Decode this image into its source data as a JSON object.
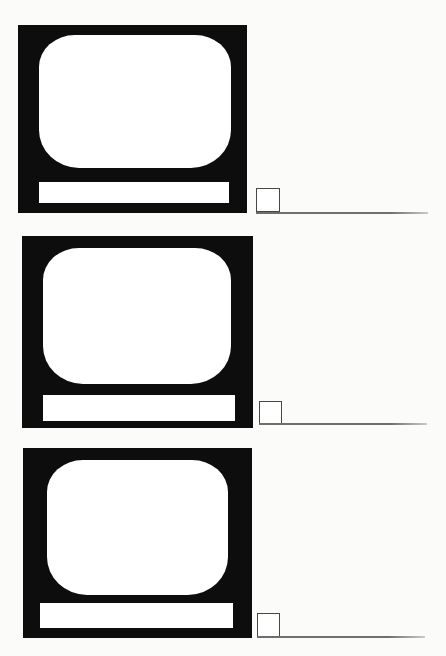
{
  "theme": {
    "paper": "#fbfbf9",
    "ink": "#0d0d0d",
    "screen": "#ffffff",
    "rule_line": "#6e6e6e",
    "box_border": "#474747"
  },
  "page": {
    "kind": "worksheet-page",
    "figure_repeated": "television-set-icon",
    "item_count": 3
  },
  "items": [
    {
      "figure": "television-set",
      "answer_box_value": "",
      "answer_line_value": ""
    },
    {
      "figure": "television-set",
      "answer_box_value": "",
      "answer_line_value": ""
    },
    {
      "figure": "television-set",
      "answer_box_value": "",
      "answer_line_value": ""
    }
  ]
}
